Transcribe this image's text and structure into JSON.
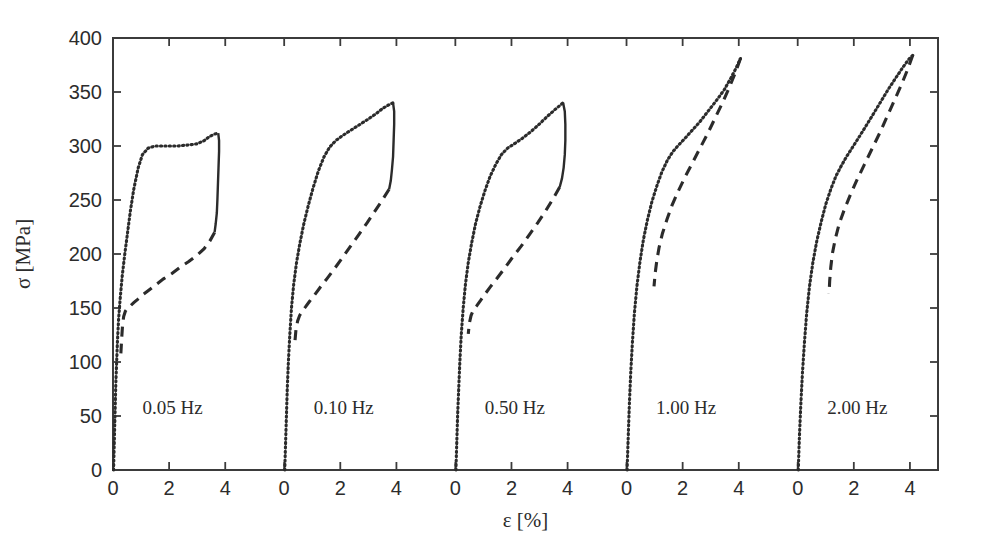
{
  "chart_data": {
    "type": "line",
    "title": "",
    "xlabel": "ε [%]",
    "ylabel": "σ [MPa]",
    "ylim": [
      0,
      400
    ],
    "yticks": [
      0,
      50,
      100,
      150,
      200,
      250,
      300,
      350,
      400
    ],
    "ytick_labels": [
      "0",
      "50",
      "100",
      "150",
      "200",
      "250",
      "300",
      "350",
      "400"
    ],
    "xlim_per_panel": [
      0,
      5
    ],
    "xticks_per_panel": [
      0,
      2,
      4
    ],
    "xtick_labels_per_panel": [
      "0",
      "2",
      "4"
    ],
    "grid": false,
    "legend": "none",
    "panel_count": 5,
    "panel_offsets_strain_pct": [
      0,
      6.1,
      12.2,
      18.3,
      24.4
    ],
    "annotations": [
      "0.05 Hz",
      "0.10 Hz",
      "0.50 Hz",
      "1.00 Hz",
      "2.00 Hz"
    ],
    "annotation_y_MPa": 52,
    "line_styles": {
      "loading": "dotted",
      "unloading": "dashed",
      "peak_drop": "solid"
    },
    "series": [
      {
        "name": "0.05 Hz",
        "panel": 0,
        "peak_stress_MPa": 312,
        "peak_strain_pct": 3.72,
        "plateau_stress_MPa": 300,
        "loading_dotted": [
          [
            0.02,
            0
          ],
          [
            0.04,
            20
          ],
          [
            0.06,
            40
          ],
          [
            0.08,
            60
          ],
          [
            0.1,
            80
          ],
          [
            0.13,
            100
          ],
          [
            0.16,
            120
          ],
          [
            0.2,
            140
          ],
          [
            0.26,
            160
          ],
          [
            0.33,
            180
          ],
          [
            0.42,
            200
          ],
          [
            0.52,
            220
          ],
          [
            0.62,
            240
          ],
          [
            0.74,
            260
          ],
          [
            0.9,
            280
          ],
          [
            1.05,
            292
          ],
          [
            1.25,
            298
          ],
          [
            1.5,
            300
          ],
          [
            1.9,
            300
          ],
          [
            2.3,
            300
          ],
          [
            2.7,
            301
          ],
          [
            3.0,
            302
          ],
          [
            3.25,
            305
          ],
          [
            3.45,
            309
          ],
          [
            3.62,
            311
          ],
          [
            3.75,
            312
          ]
        ],
        "peak_drop_solid": [
          [
            3.75,
            312
          ],
          [
            3.78,
            305
          ],
          [
            3.78,
            295
          ],
          [
            3.76,
            280
          ],
          [
            3.74,
            265
          ],
          [
            3.72,
            250
          ],
          [
            3.7,
            238
          ],
          [
            3.66,
            228
          ],
          [
            3.62,
            220
          ]
        ],
        "unloading_dashed": [
          [
            3.62,
            220
          ],
          [
            3.45,
            212
          ],
          [
            3.25,
            205
          ],
          [
            3.0,
            199
          ],
          [
            2.7,
            193
          ],
          [
            2.4,
            188
          ],
          [
            2.1,
            182
          ],
          [
            1.8,
            177
          ],
          [
            1.5,
            171
          ],
          [
            1.25,
            166
          ],
          [
            1.05,
            162
          ],
          [
            0.88,
            158
          ],
          [
            0.74,
            155
          ],
          [
            0.62,
            152
          ],
          [
            0.52,
            150
          ],
          [
            0.44,
            147
          ],
          [
            0.38,
            142
          ],
          [
            0.34,
            134
          ],
          [
            0.31,
            122
          ],
          [
            0.28,
            108
          ]
        ]
      },
      {
        "name": "0.10 Hz",
        "panel": 1,
        "peak_stress_MPa": 340,
        "peak_strain_pct": 3.85,
        "loading_dotted": [
          [
            0.02,
            0
          ],
          [
            0.05,
            25
          ],
          [
            0.08,
            50
          ],
          [
            0.11,
            75
          ],
          [
            0.15,
            100
          ],
          [
            0.2,
            125
          ],
          [
            0.26,
            150
          ],
          [
            0.34,
            172
          ],
          [
            0.44,
            192
          ],
          [
            0.56,
            210
          ],
          [
            0.7,
            228
          ],
          [
            0.86,
            245
          ],
          [
            1.04,
            262
          ],
          [
            1.22,
            277
          ],
          [
            1.42,
            290
          ],
          [
            1.62,
            299
          ],
          [
            1.84,
            305
          ],
          [
            2.1,
            310
          ],
          [
            2.4,
            315
          ],
          [
            2.7,
            320
          ],
          [
            3.0,
            325
          ],
          [
            3.28,
            330
          ],
          [
            3.52,
            335
          ],
          [
            3.72,
            338
          ],
          [
            3.88,
            340
          ]
        ],
        "peak_drop_solid": [
          [
            3.88,
            340
          ],
          [
            3.92,
            332
          ],
          [
            3.92,
            320
          ],
          [
            3.9,
            305
          ],
          [
            3.88,
            290
          ],
          [
            3.84,
            278
          ],
          [
            3.8,
            268
          ],
          [
            3.74,
            260
          ]
        ],
        "unloading_dashed": [
          [
            3.74,
            260
          ],
          [
            3.5,
            250
          ],
          [
            3.24,
            240
          ],
          [
            2.96,
            229
          ],
          [
            2.66,
            218
          ],
          [
            2.36,
            207
          ],
          [
            2.06,
            196
          ],
          [
            1.78,
            186
          ],
          [
            1.52,
            177
          ],
          [
            1.28,
            169
          ],
          [
            1.08,
            162
          ],
          [
            0.9,
            156
          ],
          [
            0.76,
            151
          ],
          [
            0.64,
            147
          ],
          [
            0.55,
            143
          ],
          [
            0.48,
            138
          ],
          [
            0.42,
            130
          ],
          [
            0.38,
            118
          ]
        ]
      },
      {
        "name": "0.50 Hz",
        "panel": 2,
        "peak_stress_MPa": 340,
        "peak_strain_pct": 3.8,
        "loading_dotted": [
          [
            0.02,
            0
          ],
          [
            0.05,
            25
          ],
          [
            0.08,
            50
          ],
          [
            0.12,
            75
          ],
          [
            0.16,
            100
          ],
          [
            0.21,
            125
          ],
          [
            0.28,
            150
          ],
          [
            0.36,
            172
          ],
          [
            0.46,
            192
          ],
          [
            0.58,
            210
          ],
          [
            0.72,
            228
          ],
          [
            0.88,
            244
          ],
          [
            1.06,
            259
          ],
          [
            1.24,
            272
          ],
          [
            1.44,
            283
          ],
          [
            1.64,
            292
          ],
          [
            1.86,
            298
          ],
          [
            2.1,
            302
          ],
          [
            2.38,
            307
          ],
          [
            2.68,
            313
          ],
          [
            2.98,
            320
          ],
          [
            3.26,
            327
          ],
          [
            3.52,
            333
          ],
          [
            3.7,
            337
          ],
          [
            3.84,
            340
          ]
        ],
        "peak_drop_solid": [
          [
            3.84,
            340
          ],
          [
            3.9,
            332
          ],
          [
            3.92,
            320
          ],
          [
            3.92,
            305
          ],
          [
            3.9,
            292
          ],
          [
            3.86,
            280
          ],
          [
            3.8,
            270
          ],
          [
            3.72,
            262
          ]
        ],
        "unloading_dashed": [
          [
            3.72,
            262
          ],
          [
            3.48,
            251
          ],
          [
            3.22,
            240
          ],
          [
            2.94,
            229
          ],
          [
            2.64,
            218
          ],
          [
            2.34,
            207
          ],
          [
            2.04,
            197
          ],
          [
            1.76,
            187
          ],
          [
            1.5,
            178
          ],
          [
            1.26,
            170
          ],
          [
            1.06,
            163
          ],
          [
            0.9,
            157
          ],
          [
            0.76,
            152
          ],
          [
            0.64,
            148
          ],
          [
            0.56,
            143
          ],
          [
            0.5,
            136
          ],
          [
            0.46,
            126
          ]
        ]
      },
      {
        "name": "1.00 Hz",
        "panel": 3,
        "peak_stress_MPa": 381,
        "peak_strain_pct": 4.02,
        "loading_dotted": [
          [
            0.02,
            0
          ],
          [
            0.06,
            30
          ],
          [
            0.1,
            60
          ],
          [
            0.15,
            90
          ],
          [
            0.21,
            118
          ],
          [
            0.28,
            145
          ],
          [
            0.37,
            170
          ],
          [
            0.48,
            193
          ],
          [
            0.6,
            213
          ],
          [
            0.74,
            231
          ],
          [
            0.9,
            248
          ],
          [
            1.08,
            263
          ],
          [
            1.26,
            276
          ],
          [
            1.46,
            287
          ],
          [
            1.66,
            295
          ],
          [
            1.86,
            301
          ],
          [
            2.08,
            307
          ],
          [
            2.32,
            314
          ],
          [
            2.6,
            322
          ],
          [
            2.9,
            332
          ],
          [
            3.2,
            342
          ],
          [
            3.48,
            352
          ],
          [
            3.72,
            363
          ],
          [
            3.92,
            373
          ],
          [
            4.06,
            381
          ]
        ],
        "unloading_dashed": [
          [
            4.06,
            381
          ],
          [
            3.88,
            368
          ],
          [
            3.66,
            354
          ],
          [
            3.42,
            340
          ],
          [
            3.16,
            326
          ],
          [
            2.9,
            312
          ],
          [
            2.62,
            298
          ],
          [
            2.34,
            284
          ],
          [
            2.08,
            271
          ],
          [
            1.84,
            258
          ],
          [
            1.62,
            245
          ],
          [
            1.44,
            232
          ],
          [
            1.28,
            219
          ],
          [
            1.16,
            206
          ],
          [
            1.08,
            194
          ],
          [
            1.02,
            182
          ],
          [
            0.98,
            170
          ]
        ]
      },
      {
        "name": "2.00 Hz",
        "panel": 4,
        "peak_stress_MPa": 384,
        "peak_strain_pct": 4.05,
        "loading_dotted": [
          [
            0.02,
            0
          ],
          [
            0.06,
            30
          ],
          [
            0.11,
            60
          ],
          [
            0.17,
            90
          ],
          [
            0.24,
            118
          ],
          [
            0.32,
            145
          ],
          [
            0.42,
            170
          ],
          [
            0.54,
            192
          ],
          [
            0.68,
            212
          ],
          [
            0.84,
            230
          ],
          [
            1.0,
            246
          ],
          [
            1.18,
            260
          ],
          [
            1.36,
            272
          ],
          [
            1.56,
            282
          ],
          [
            1.76,
            291
          ],
          [
            1.96,
            299
          ],
          [
            2.18,
            308
          ],
          [
            2.42,
            318
          ],
          [
            2.68,
            329
          ],
          [
            2.96,
            341
          ],
          [
            3.24,
            353
          ],
          [
            3.52,
            364
          ],
          [
            3.78,
            374
          ],
          [
            3.98,
            381
          ],
          [
            4.1,
            384
          ]
        ],
        "unloading_dashed": [
          [
            4.1,
            384
          ],
          [
            3.92,
            371
          ],
          [
            3.7,
            357
          ],
          [
            3.46,
            343
          ],
          [
            3.2,
            328
          ],
          [
            2.94,
            313
          ],
          [
            2.66,
            298
          ],
          [
            2.38,
            283
          ],
          [
            2.12,
            269
          ],
          [
            1.88,
            255
          ],
          [
            1.66,
            241
          ],
          [
            1.48,
            228
          ],
          [
            1.34,
            214
          ],
          [
            1.24,
            201
          ],
          [
            1.18,
            188
          ],
          [
            1.14,
            175
          ],
          [
            1.12,
            163
          ]
        ]
      }
    ]
  },
  "axes": {
    "x_axis_label": "ε [%]",
    "y_axis_label": "σ [MPa]"
  }
}
